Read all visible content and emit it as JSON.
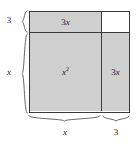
{
  "figure": {
    "regions": [
      {
        "id": "top-strip",
        "label": "3x",
        "label_coefficient": "3",
        "label_variable": "x",
        "shaded": true,
        "fill": "#cfcfcf"
      },
      {
        "id": "main-square",
        "label": "x²",
        "label_base": "x",
        "label_exponent": "2",
        "shaded": true,
        "fill": "#cfcfcf"
      },
      {
        "id": "right-strip",
        "label": "3x",
        "label_coefficient": "3",
        "label_variable": "x",
        "shaded": true,
        "fill": "#cfcfcf"
      },
      {
        "id": "corner-square",
        "label": "",
        "shaded": false,
        "fill": "#ffffff"
      }
    ],
    "dimensions": [
      {
        "id": "left-top",
        "side": "left",
        "label": "3",
        "style": "upright"
      },
      {
        "id": "left-bottom",
        "side": "left",
        "label": "x",
        "style": "italic"
      },
      {
        "id": "bottom-left",
        "side": "bottom",
        "label": "x",
        "style": "italic"
      },
      {
        "id": "bottom-right",
        "side": "bottom",
        "label": "3",
        "style": "upright"
      }
    ],
    "colors": {
      "shaded_fill": "#cfcfcf",
      "unshaded_fill": "#ffffff",
      "stroke": "#3a3a3a",
      "brace_stroke": "#555555",
      "text": "#1a1a1a"
    }
  }
}
